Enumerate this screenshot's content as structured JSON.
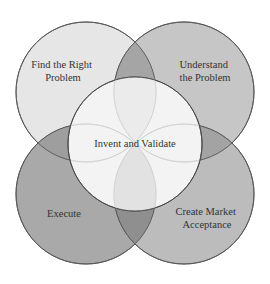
{
  "diagram": {
    "type": "venn",
    "circles": [
      {
        "id": "top-left",
        "label_lines": [
          "Find the Right",
          "Problem"
        ],
        "fill": "#e8e8e8"
      },
      {
        "id": "top-right",
        "label_lines": [
          "Understand",
          "the Problem"
        ],
        "fill": "#c4c4c4"
      },
      {
        "id": "bottom-left",
        "label_lines": [
          "Execute"
        ],
        "fill": "#a8a8a8"
      },
      {
        "id": "bottom-right",
        "label_lines": [
          "Create Market",
          "Acceptance"
        ],
        "fill": "#bdbdbd"
      },
      {
        "id": "center",
        "label_lines": [
          "Invent and Validate"
        ],
        "fill": "#f4f4f4"
      }
    ],
    "stroke": "#555555"
  }
}
